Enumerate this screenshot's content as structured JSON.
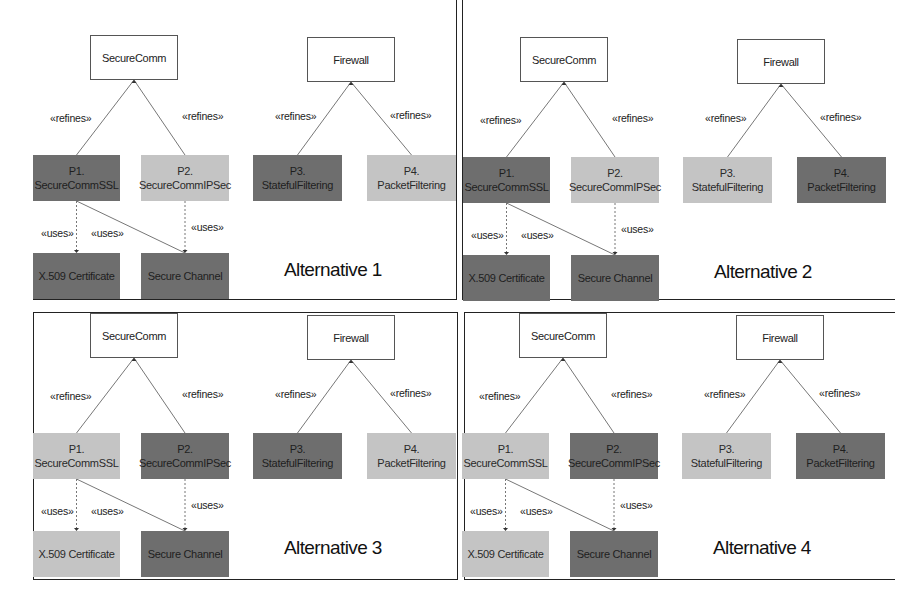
{
  "figure": {
    "alternatives": [
      {
        "title": "Alternative 1",
        "parent_1": "SecureComm",
        "parent_2": "Firewall",
        "refines_label": "«refines»",
        "uses_label": "«uses»",
        "p1": {
          "id": "P1.",
          "name": "SecureCommSSL",
          "shade": "dark"
        },
        "p2": {
          "id": "P2.",
          "name": "SecureCommIPSec",
          "shade": "light"
        },
        "p3": {
          "id": "P3.",
          "name": "StatefulFiltering",
          "shade": "dark"
        },
        "p4": {
          "id": "P4.",
          "name": "PacketFiltering",
          "shade": "light"
        },
        "c1": {
          "name": "X.509 Certificate",
          "shade": "dark"
        },
        "c2": {
          "name": "Secure Channel",
          "shade": "dark"
        }
      },
      {
        "title": "Alternative 2",
        "parent_1": "SecureComm",
        "parent_2": "Firewall",
        "refines_label": "«refines»",
        "uses_label": "«uses»",
        "p1": {
          "id": "P1.",
          "name": "SecureCommSSL",
          "shade": "dark"
        },
        "p2": {
          "id": "P2.",
          "name": "SecureCommIPSec",
          "shade": "light"
        },
        "p3": {
          "id": "P3.",
          "name": "StatefulFiltering",
          "shade": "light"
        },
        "p4": {
          "id": "P4.",
          "name": "PacketFiltering",
          "shade": "dark"
        },
        "c1": {
          "name": "X.509 Certificate",
          "shade": "dark"
        },
        "c2": {
          "name": "Secure Channel",
          "shade": "dark"
        }
      },
      {
        "title": "Alternative 3",
        "parent_1": "SecureComm",
        "parent_2": "Firewall",
        "refines_label": "«refines»",
        "uses_label": "«uses»",
        "p1": {
          "id": "P1.",
          "name": "SecureCommSSL",
          "shade": "light"
        },
        "p2": {
          "id": "P2.",
          "name": "SecureCommIPSec",
          "shade": "dark"
        },
        "p3": {
          "id": "P3.",
          "name": "StatefulFiltering",
          "shade": "dark"
        },
        "p4": {
          "id": "P4.",
          "name": "PacketFiltering",
          "shade": "light"
        },
        "c1": {
          "name": "X.509 Certificate",
          "shade": "light"
        },
        "c2": {
          "name": "Secure Channel",
          "shade": "dark"
        }
      },
      {
        "title": "Alternative 4",
        "parent_1": "SecureComm",
        "parent_2": "Firewall",
        "refines_label": "«refines»",
        "uses_label": "«uses»",
        "p1": {
          "id": "P1.",
          "name": "SecureCommSSL",
          "shade": "light"
        },
        "p2": {
          "id": "P2.",
          "name": "SecureCommIPSec",
          "shade": "dark"
        },
        "p3": {
          "id": "P3.",
          "name": "StatefulFiltering",
          "shade": "light"
        },
        "p4": {
          "id": "P4.",
          "name": "PacketFiltering",
          "shade": "dark"
        },
        "c1": {
          "name": "X.509 Certificate",
          "shade": "light"
        },
        "c2": {
          "name": "Secure Channel",
          "shade": "dark"
        }
      }
    ],
    "colors": {
      "dark": "#6e6e6e",
      "light": "#c4c4c4",
      "frame": "#222222"
    }
  }
}
